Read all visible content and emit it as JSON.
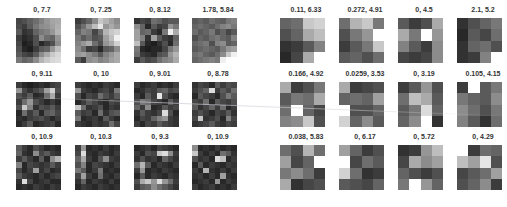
{
  "panels": [
    {
      "name": "left",
      "grid_size": 8,
      "tiles": [
        {
          "label": "0, 7.7",
          "cells": [
            70,
            80,
            95,
            110,
            130,
            150,
            165,
            170,
            75,
            60,
            90,
            120,
            140,
            145,
            160,
            175,
            90,
            50,
            60,
            100,
            120,
            130,
            150,
            180,
            60,
            40,
            50,
            80,
            140,
            110,
            100,
            150,
            70,
            30,
            40,
            80,
            40,
            60,
            80,
            140,
            80,
            40,
            30,
            60,
            90,
            100,
            150,
            190,
            90,
            70,
            60,
            90,
            140,
            170,
            200,
            215,
            120,
            100,
            110,
            140,
            180,
            200,
            215,
            220
          ]
        },
        {
          "label": "0, 7.25",
          "cells": [
            60,
            80,
            100,
            140,
            200,
            180,
            160,
            140,
            80,
            110,
            150,
            190,
            230,
            150,
            170,
            150,
            100,
            130,
            120,
            70,
            110,
            180,
            200,
            210,
            120,
            90,
            110,
            80,
            90,
            160,
            190,
            240,
            130,
            150,
            170,
            110,
            80,
            150,
            170,
            210,
            140,
            110,
            60,
            70,
            40,
            90,
            100,
            140,
            150,
            160,
            140,
            120,
            90,
            130,
            150,
            170,
            90,
            60,
            140,
            150,
            130,
            140,
            160,
            170
          ]
        },
        {
          "label": "0, 8.12",
          "cells": [
            50,
            70,
            60,
            110,
            100,
            80,
            90,
            90,
            140,
            100,
            40,
            90,
            60,
            70,
            150,
            120,
            160,
            100,
            110,
            60,
            40,
            120,
            240,
            170,
            160,
            130,
            50,
            160,
            90,
            60,
            50,
            100,
            190,
            90,
            40,
            30,
            50,
            80,
            40,
            110,
            120,
            40,
            30,
            40,
            40,
            70,
            120,
            150,
            110,
            60,
            50,
            40,
            80,
            90,
            150,
            180,
            60,
            90,
            70,
            80,
            110,
            130,
            140,
            170
          ]
        },
        {
          "label": "1.78, 5.84",
          "cells": [
            90,
            100,
            90,
            110,
            100,
            95,
            120,
            130,
            100,
            110,
            100,
            90,
            110,
            130,
            140,
            120,
            110,
            90,
            100,
            120,
            80,
            100,
            70,
            90,
            80,
            100,
            90,
            110,
            120,
            100,
            90,
            130,
            100,
            110,
            120,
            80,
            130,
            140,
            90,
            100,
            90,
            100,
            110,
            100,
            90,
            120,
            150,
            160,
            110,
            120,
            100,
            90,
            110,
            140,
            200,
            240,
            100,
            110,
            120,
            130,
            120,
            240,
            255,
            255
          ]
        },
        {
          "label": "0, 9.11",
          "cells": [
            60,
            40,
            30,
            40,
            50,
            40,
            60,
            70,
            150,
            70,
            50,
            70,
            90,
            160,
            210,
            80,
            80,
            60,
            90,
            40,
            50,
            110,
            170,
            60,
            60,
            110,
            150,
            80,
            60,
            40,
            60,
            40,
            80,
            200,
            130,
            50,
            80,
            70,
            90,
            60,
            40,
            110,
            60,
            90,
            40,
            90,
            100,
            70,
            50,
            40,
            60,
            70,
            80,
            60,
            40,
            60,
            40,
            60,
            90,
            40,
            50,
            60,
            70,
            40
          ]
        },
        {
          "label": "0, 10",
          "cells": [
            60,
            50,
            40,
            50,
            40,
            60,
            50,
            40,
            150,
            60,
            50,
            40,
            60,
            70,
            50,
            120,
            80,
            40,
            70,
            60,
            110,
            80,
            60,
            90,
            40,
            60,
            90,
            70,
            50,
            40,
            70,
            60,
            200,
            110,
            50,
            60,
            80,
            40,
            60,
            50,
            90,
            60,
            70,
            40,
            110,
            50,
            80,
            90,
            120,
            40,
            50,
            60,
            40,
            90,
            60,
            40,
            60,
            50,
            40,
            60,
            50,
            60,
            110,
            70
          ]
        },
        {
          "label": "0, 9.01",
          "cells": [
            60,
            40,
            50,
            60,
            40,
            50,
            40,
            60,
            40,
            50,
            70,
            60,
            90,
            100,
            70,
            80,
            60,
            40,
            90,
            60,
            230,
            80,
            50,
            40,
            80,
            120,
            110,
            70,
            60,
            40,
            90,
            60,
            100,
            60,
            140,
            40,
            50,
            90,
            60,
            70,
            50,
            90,
            60,
            50,
            70,
            220,
            80,
            40,
            40,
            70,
            60,
            100,
            130,
            150,
            60,
            50,
            60,
            40,
            70,
            60,
            90,
            70,
            60,
            50
          ]
        },
        {
          "label": "0, 8.78",
          "cells": [
            50,
            70,
            60,
            40,
            90,
            60,
            80,
            70,
            60,
            80,
            100,
            220,
            60,
            90,
            70,
            110,
            40,
            90,
            70,
            60,
            40,
            80,
            120,
            90,
            70,
            60,
            110,
            40,
            90,
            70,
            60,
            80,
            90,
            50,
            70,
            100,
            60,
            110,
            40,
            60,
            60,
            80,
            60,
            40,
            70,
            60,
            90,
            50,
            70,
            200,
            50,
            60,
            80,
            40,
            130,
            70,
            50,
            60,
            70,
            90,
            60,
            50,
            70,
            60
          ]
        },
        {
          "label": "0, 10.9",
          "cells": [
            90,
            60,
            40,
            80,
            60,
            40,
            50,
            40,
            100,
            50,
            40,
            140,
            70,
            90,
            60,
            50,
            60,
            90,
            60,
            40,
            90,
            40,
            140,
            180,
            130,
            40,
            70,
            60,
            50,
            60,
            90,
            60,
            70,
            40,
            60,
            160,
            50,
            70,
            40,
            50,
            90,
            60,
            50,
            40,
            60,
            40,
            60,
            70,
            50,
            220,
            70,
            40,
            50,
            60,
            40,
            40,
            40,
            50,
            40,
            60,
            50,
            40,
            60,
            50
          ]
        },
        {
          "label": "0, 10.3",
          "cells": [
            60,
            150,
            40,
            50,
            40,
            60,
            40,
            50,
            70,
            220,
            50,
            40,
            60,
            50,
            40,
            60,
            100,
            170,
            60,
            40,
            80,
            140,
            60,
            50,
            80,
            130,
            40,
            70,
            60,
            50,
            40,
            60,
            120,
            90,
            40,
            60,
            120,
            40,
            50,
            40,
            70,
            160,
            60,
            40,
            110,
            50,
            40,
            60,
            50,
            100,
            40,
            60,
            50,
            40,
            60,
            40,
            40,
            60,
            50,
            40,
            60,
            50,
            40,
            50
          ]
        },
        {
          "label": "0, 9.3",
          "cells": [
            40,
            50,
            60,
            40,
            70,
            60,
            50,
            40,
            60,
            40,
            80,
            70,
            200,
            220,
            140,
            60,
            50,
            80,
            50,
            60,
            40,
            100,
            70,
            50,
            110,
            180,
            90,
            40,
            60,
            50,
            40,
            60,
            60,
            150,
            40,
            50,
            40,
            60,
            50,
            40,
            40,
            90,
            40,
            60,
            50,
            40,
            60,
            50,
            80,
            170,
            200,
            150,
            220,
            150,
            110,
            60,
            60,
            90,
            100,
            140,
            110,
            90,
            70,
            50
          ]
        },
        {
          "label": "0, 10.9",
          "cells": [
            140,
            40,
            50,
            40,
            60,
            40,
            50,
            40,
            200,
            60,
            40,
            60,
            40,
            110,
            90,
            50,
            80,
            50,
            60,
            40,
            220,
            190,
            40,
            60,
            40,
            90,
            40,
            60,
            50,
            40,
            60,
            50,
            60,
            40,
            180,
            50,
            40,
            60,
            40,
            60,
            50,
            60,
            40,
            60,
            40,
            160,
            50,
            40,
            40,
            50,
            60,
            40,
            150,
            40,
            60,
            50,
            60,
            40,
            50,
            60,
            40,
            50,
            40,
            60
          ]
        }
      ]
    },
    {
      "name": "right",
      "grid_size": 4,
      "tiles": [
        {
          "label": "0.11, 6.33",
          "cells": [
            100,
            110,
            200,
            210,
            80,
            100,
            170,
            190,
            50,
            60,
            90,
            130,
            40,
            70,
            170,
            255
          ]
        },
        {
          "label": "0.272, 4.91",
          "cells": [
            110,
            180,
            200,
            120,
            80,
            120,
            150,
            255,
            60,
            90,
            120,
            200,
            90,
            100,
            80,
            110
          ]
        },
        {
          "label": "0, 4.5",
          "cells": [
            90,
            60,
            80,
            170,
            170,
            120,
            255,
            150,
            130,
            90,
            60,
            140,
            70,
            60,
            70,
            140
          ]
        },
        {
          "label": "2.1, 5.2",
          "cells": [
            50,
            80,
            100,
            120,
            40,
            90,
            70,
            110,
            50,
            100,
            110,
            80,
            50,
            60,
            130,
            255
          ]
        },
        {
          "label": "0.166, 4.92",
          "cells": [
            170,
            60,
            80,
            120,
            90,
            120,
            110,
            170,
            110,
            255,
            100,
            70,
            130,
            140,
            200,
            80
          ]
        },
        {
          "label": "0.0259, 3.53",
          "cells": [
            170,
            60,
            70,
            80,
            100,
            110,
            100,
            160,
            255,
            80,
            80,
            100,
            210,
            100,
            140,
            90
          ]
        },
        {
          "label": "0, 3.19",
          "cells": [
            60,
            90,
            150,
            80,
            110,
            190,
            170,
            90,
            90,
            120,
            220,
            100,
            100,
            140,
            255,
            50
          ]
        },
        {
          "label": "0.105, 4.15",
          "cells": [
            60,
            255,
            90,
            120,
            120,
            100,
            90,
            140,
            140,
            110,
            80,
            120,
            130,
            90,
            50,
            110
          ]
        },
        {
          "label": "0.038, 5.83",
          "cells": [
            110,
            80,
            180,
            110,
            160,
            70,
            100,
            255,
            120,
            140,
            110,
            60,
            170,
            50,
            70,
            80
          ]
        },
        {
          "label": "0, 6.17",
          "cells": [
            160,
            100,
            60,
            80,
            255,
            70,
            110,
            90,
            210,
            110,
            50,
            60,
            90,
            80,
            70,
            100
          ]
        },
        {
          "label": "0, 5.72",
          "cells": [
            50,
            60,
            150,
            190,
            70,
            170,
            140,
            160,
            100,
            80,
            60,
            80,
            120,
            255,
            150,
            100
          ]
        },
        {
          "label": "0, 4.29",
          "cells": [
            255,
            60,
            110,
            100,
            190,
            160,
            230,
            80,
            70,
            90,
            110,
            160,
            80,
            100,
            140,
            60
          ]
        }
      ]
    }
  ]
}
